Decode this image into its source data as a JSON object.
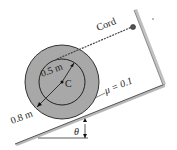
{
  "diagram": {
    "labels": {
      "cord": "Cord",
      "inner_radius": "0.5 m",
      "center": "C",
      "outer_radius": "0.8 m",
      "friction": "μ = 0.1",
      "angle": "θ"
    },
    "colors": {
      "spool_fill": "#a8a8a8",
      "spool_stroke": "#333333",
      "incline": "#b0b0b0",
      "line": "#333333"
    }
  }
}
